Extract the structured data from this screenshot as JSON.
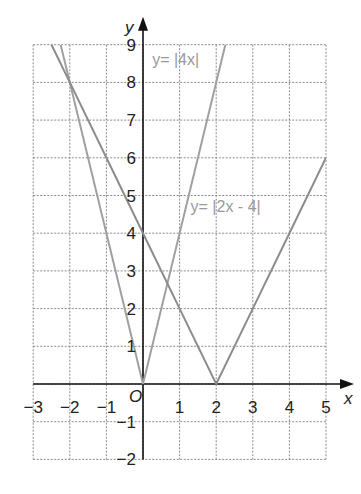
{
  "chart_data": {
    "type": "line",
    "title": "",
    "xlabel": "x",
    "ylabel": "y",
    "origin_label": "O",
    "xlim": [
      -3,
      5
    ],
    "ylim": [
      -2,
      9
    ],
    "grid": true,
    "x_ticks": [
      "-3",
      "-2",
      "-1",
      "1",
      "2",
      "3",
      "4",
      "5"
    ],
    "y_ticks": [
      "9",
      "8",
      "7",
      "6",
      "5",
      "4",
      "3",
      "2",
      "1",
      "-1",
      "-2"
    ],
    "series": [
      {
        "name": "y= |4x|",
        "label": "y= |4x|",
        "color": "#a0a0a0",
        "x": [
          -2.25,
          -2,
          -1,
          0,
          1,
          2,
          2.25
        ],
        "y": [
          9,
          8,
          4,
          0,
          4,
          8,
          9
        ]
      },
      {
        "name": "y= |2x - 4|",
        "label": "y= |2x - 4|",
        "color": "#8c8c8c",
        "x": [
          -2.5,
          -2,
          -1,
          0,
          1,
          2,
          3,
          4,
          5
        ],
        "y": [
          9,
          8,
          6,
          4,
          2,
          0,
          2,
          4,
          6
        ]
      }
    ]
  }
}
